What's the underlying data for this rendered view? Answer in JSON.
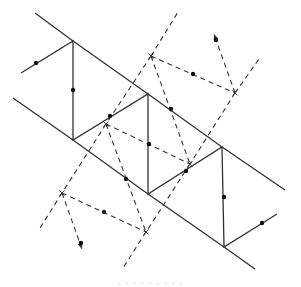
{
  "diagram": {
    "type": "voronoi-delaunay-strip",
    "stroke_color": "#333333",
    "solid_width": 1.3,
    "dashed_width": 1.1,
    "dash_pattern": "5,4",
    "dot_radius": 2.2,
    "solid_lines": [
      {
        "id": "upper-boundary",
        "points": [
          [
            35,
            13
          ],
          [
            73,
            41
          ],
          [
            148,
            94
          ],
          [
            222,
            147
          ],
          [
            285,
            190
          ]
        ]
      },
      {
        "id": "lower-boundary",
        "points": [
          [
            13,
            98
          ],
          [
            73,
            140
          ],
          [
            148,
            194
          ],
          [
            224,
            247
          ],
          [
            255,
            269
          ]
        ]
      },
      {
        "id": "zigzag",
        "points": [
          [
            21,
            73
          ],
          [
            73,
            41
          ],
          [
            73,
            140
          ],
          [
            148,
            94
          ],
          [
            148,
            194
          ],
          [
            222,
            147
          ],
          [
            224,
            247
          ],
          [
            277,
            214
          ]
        ]
      }
    ],
    "dashed_lines": [
      {
        "id": "cell-a-up",
        "points": [
          [
            151,
            56
          ],
          [
            178,
            12
          ]
        ]
      },
      {
        "id": "cell-a-down",
        "points": [
          [
            151,
            56
          ],
          [
            106,
            124
          ]
        ]
      },
      {
        "id": "cell-a-right",
        "points": [
          [
            151,
            56
          ],
          [
            235,
            93
          ]
        ]
      },
      {
        "id": "cell-b-up",
        "points": [
          [
            235,
            93
          ],
          [
            259,
            59
          ]
        ]
      },
      {
        "id": "cell-b-arrow",
        "points": [
          [
            235,
            93
          ],
          [
            214,
            34
          ]
        ]
      },
      {
        "id": "cell-b-down",
        "points": [
          [
            235,
            93
          ],
          [
            190,
            164
          ]
        ]
      },
      {
        "id": "cell-c-left",
        "points": [
          [
            106,
            124
          ],
          [
            62,
            193
          ]
        ]
      },
      {
        "id": "cell-c-right",
        "points": [
          [
            106,
            124
          ],
          [
            190,
            164
          ]
        ]
      },
      {
        "id": "cell-c-down",
        "points": [
          [
            106,
            124
          ],
          [
            146,
            232
          ]
        ]
      },
      {
        "id": "cell-d-up",
        "points": [
          [
            151,
            56
          ],
          [
            190,
            164
          ]
        ]
      },
      {
        "id": "cell-d-down",
        "points": [
          [
            190,
            164
          ],
          [
            146,
            232
          ]
        ]
      },
      {
        "id": "cell-e-left-down",
        "points": [
          [
            62,
            193
          ],
          [
            40,
            228
          ]
        ]
      },
      {
        "id": "cell-e-arrow",
        "points": [
          [
            62,
            193
          ],
          [
            82,
            249
          ]
        ]
      },
      {
        "id": "cell-e-right",
        "points": [
          [
            62,
            193
          ],
          [
            146,
            232
          ]
        ]
      },
      {
        "id": "cell-f-down",
        "points": [
          [
            146,
            232
          ],
          [
            123,
            268
          ]
        ]
      }
    ],
    "arrow_tips": [
      {
        "id": "arrow-top",
        "at": [
          214,
          34
        ],
        "from": [
          235,
          93
        ]
      },
      {
        "id": "arrow-bottom",
        "at": [
          82,
          249
        ],
        "from": [
          62,
          193
        ]
      }
    ],
    "dots": [
      [
        36,
        63
      ],
      [
        73,
        90
      ],
      [
        110,
        116
      ],
      [
        149,
        144
      ],
      [
        126,
        179
      ],
      [
        171,
        109
      ],
      [
        186,
        171
      ],
      [
        224,
        197
      ],
      [
        262,
        223
      ],
      [
        193,
        74
      ],
      [
        216,
        40
      ],
      [
        104,
        212
      ],
      [
        81,
        243
      ]
    ],
    "cross_marks": [
      [
        151,
        56
      ],
      [
        235,
        93
      ],
      [
        106,
        124
      ],
      [
        190,
        164
      ],
      [
        62,
        193
      ],
      [
        146,
        232
      ]
    ]
  },
  "caption": {
    "text": "· · ·   · ·   · ·   · ·"
  }
}
